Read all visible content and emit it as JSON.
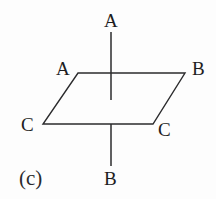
{
  "figure": {
    "caption": "(c)",
    "background_color": "#fdfdfd",
    "stroke_color": "#2b2b2d",
    "text_color": "#1d1d1f",
    "stroke_width": 1.4,
    "width": 216,
    "height": 199
  },
  "labels": {
    "axis_top": "A",
    "vertex_top_left": "A",
    "vertex_top_right": "B",
    "vertex_bottom_left": "C",
    "vertex_bottom_right": "C",
    "axis_bottom": "B"
  },
  "chart_data": {
    "type": "diagram",
    "title": "(c)",
    "shapes": [
      {
        "name": "parallelogram",
        "points": [
          {
            "x": 78,
            "y": 73
          },
          {
            "x": 185,
            "y": 73
          },
          {
            "x": 153,
            "y": 124
          },
          {
            "x": 43,
            "y": 124
          }
        ],
        "closed": true
      },
      {
        "name": "vertical-axis-upper",
        "points": [
          {
            "x": 111,
            "y": 32
          },
          {
            "x": 111,
            "y": 100
          }
        ],
        "closed": false
      },
      {
        "name": "vertical-axis-lower",
        "points": [
          {
            "x": 111,
            "y": 124
          },
          {
            "x": 111,
            "y": 166
          }
        ],
        "closed": false
      }
    ],
    "annotations": [
      {
        "text": "A",
        "x": 111,
        "y": 20,
        "role": "axis-top-label"
      },
      {
        "text": "A",
        "x": 63,
        "y": 68,
        "role": "vertex-top-left-label"
      },
      {
        "text": "B",
        "x": 199,
        "y": 68,
        "role": "vertex-top-right-label"
      },
      {
        "text": "C",
        "x": 29,
        "y": 124,
        "role": "vertex-bottom-left-label"
      },
      {
        "text": "C",
        "x": 165,
        "y": 129,
        "role": "vertex-bottom-right-label"
      },
      {
        "text": "B",
        "x": 111,
        "y": 178,
        "role": "axis-bottom-label"
      },
      {
        "text": "(c)",
        "x": 34,
        "y": 179,
        "role": "figure-caption"
      }
    ]
  }
}
